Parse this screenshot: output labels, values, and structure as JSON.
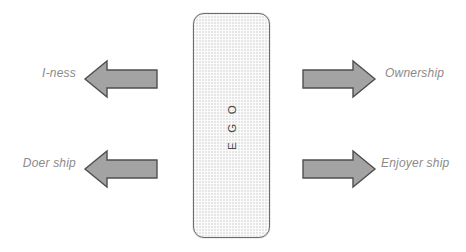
{
  "diagram": {
    "center_block": {
      "label": "E G O",
      "orientation": "vertical-rotated",
      "fill": "#fbfbfb",
      "border_color": "#6d6d6d",
      "pattern": "crosshatch"
    },
    "arrow_style": {
      "fill": "#a3a3a3",
      "stroke": "#4f4f4f"
    },
    "label_color": "#8a8a8a",
    "flows": [
      {
        "id": "i-ness",
        "label": "I-ness",
        "side": "left",
        "row": "top",
        "direction": "left"
      },
      {
        "id": "doer-ship",
        "label": "Doer ship",
        "side": "left",
        "row": "bottom",
        "direction": "left"
      },
      {
        "id": "ownership",
        "label": "Ownership",
        "side": "right",
        "row": "top",
        "direction": "right"
      },
      {
        "id": "enjoyer-ship",
        "label": "Enjoyer ship",
        "side": "right",
        "row": "bottom",
        "direction": "right"
      }
    ]
  }
}
